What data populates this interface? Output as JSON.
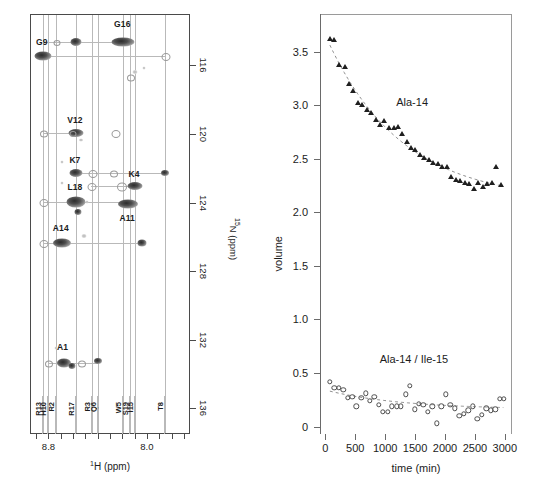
{
  "figure": {
    "panels": [
      "hsqc-spectrum",
      "kinetics-plot"
    ]
  },
  "hsqc": {
    "xaxis": {
      "title_pre": "1",
      "title": "H (ppm)",
      "ticks": [
        {
          "label": "",
          "ppm": 8.9
        },
        {
          "label": "8.8",
          "ppm": 8.8
        },
        {
          "label": "",
          "ppm": 8.7
        },
        {
          "label": "",
          "ppm": 8.6
        },
        {
          "label": "",
          "ppm": 8.5
        },
        {
          "label": "",
          "ppm": 8.4
        },
        {
          "label": "",
          "ppm": 8.3
        },
        {
          "label": "",
          "ppm": 8.2
        },
        {
          "label": "",
          "ppm": 8.1
        },
        {
          "label": "8.0",
          "ppm": 8.0
        },
        {
          "label": "",
          "ppm": 7.9
        },
        {
          "label": "",
          "ppm": 7.8
        },
        {
          "label": "",
          "ppm": 7.7
        }
      ],
      "range": [
        8.95,
        7.65
      ]
    },
    "yaxis": {
      "title_pre": "15",
      "title": "N (ppm)",
      "ticks": [
        "116",
        "120",
        "124",
        "128",
        "132",
        "136"
      ],
      "range": [
        113.0,
        137.5
      ]
    },
    "residue_ticks": [
      {
        "label": "R13",
        "ppm": 8.855
      },
      {
        "label": "H10",
        "ppm": 8.815
      },
      {
        "label": "R2",
        "ppm": 8.745
      },
      {
        "label": "R17",
        "ppm": 8.585
      },
      {
        "label": "R3",
        "ppm": 8.455
      },
      {
        "label": "Q6",
        "ppm": 8.405
      },
      {
        "label": "W5",
        "ppm": 8.2
      },
      {
        "label": "S19",
        "ppm": 8.145
      },
      {
        "label": "I15",
        "ppm": 8.105
      },
      {
        "label": "T8",
        "ppm": 7.865
      }
    ],
    "peak_labels": [
      {
        "text": "G9",
        "h": 8.855,
        "n": 114.9
      },
      {
        "text": "G16",
        "h": 8.2,
        "n": 113.9
      },
      {
        "text": "V12",
        "h": 8.585,
        "n": 119.5
      },
      {
        "text": "K7",
        "h": 8.585,
        "n": 121.8
      },
      {
        "text": "K4",
        "h": 8.105,
        "n": 122.6
      },
      {
        "text": "L18",
        "h": 8.585,
        "n": 123.4
      },
      {
        "text": "A11",
        "h": 8.16,
        "n": 125.2
      },
      {
        "text": "A14",
        "h": 8.7,
        "n": 125.8
      },
      {
        "text": "A1",
        "h": 8.685,
        "n": 132.7
      }
    ],
    "peaks": [
      {
        "h": 8.855,
        "n": 115.4,
        "w": 17,
        "hgt": 9,
        "style": "strong"
      },
      {
        "h": 8.585,
        "n": 114.6,
        "w": 11,
        "hgt": 8,
        "style": "strong"
      },
      {
        "h": 8.2,
        "n": 114.6,
        "w": 23,
        "hgt": 9,
        "style": "strong"
      },
      {
        "h": 8.745,
        "n": 114.6,
        "w": 5,
        "hgt": 4,
        "style": "ring"
      },
      {
        "h": 7.865,
        "n": 115.4,
        "w": 7,
        "hgt": 6,
        "style": "ring"
      },
      {
        "h": 8.105,
        "n": 116.3,
        "w": 5,
        "hgt": 4,
        "style": "tiny"
      },
      {
        "h": 8.145,
        "n": 116.6,
        "w": 6,
        "hgt": 5,
        "style": "ring"
      },
      {
        "h": 8.03,
        "n": 116.1,
        "w": 3,
        "hgt": 3,
        "style": "tiny"
      },
      {
        "h": 8.585,
        "n": 119.9,
        "w": 15,
        "hgt": 8,
        "style": "strong"
      },
      {
        "h": 8.855,
        "n": 119.9,
        "w": 6,
        "hgt": 5,
        "style": "ring"
      },
      {
        "h": 8.62,
        "n": 119.9,
        "w": 5,
        "hgt": 4,
        "style": "ring"
      },
      {
        "h": 8.265,
        "n": 119.9,
        "w": 7,
        "hgt": 6,
        "style": "ring"
      },
      {
        "h": 8.54,
        "n": 120.3,
        "w": 4,
        "hgt": 3,
        "style": "tiny"
      },
      {
        "h": 8.585,
        "n": 122.2,
        "w": 13,
        "hgt": 8,
        "style": "strong"
      },
      {
        "h": 8.455,
        "n": 122.2,
        "w": 7,
        "hgt": 6,
        "style": "ring"
      },
      {
        "h": 8.28,
        "n": 122.2,
        "w": 6,
        "hgt": 5,
        "style": "ring"
      },
      {
        "h": 7.865,
        "n": 122.2,
        "w": 8,
        "hgt": 6,
        "style": "strong"
      },
      {
        "h": 8.105,
        "n": 123.0,
        "w": 15,
        "hgt": 8,
        "style": "strong"
      },
      {
        "h": 8.215,
        "n": 123.0,
        "w": 8,
        "hgt": 7,
        "style": "ring"
      },
      {
        "h": 8.465,
        "n": 123.0,
        "w": 7,
        "hgt": 6,
        "style": "ring"
      },
      {
        "h": 8.7,
        "n": 121.6,
        "w": 3,
        "hgt": 3,
        "style": "tiny"
      },
      {
        "h": 8.7,
        "n": 122.8,
        "w": 3,
        "hgt": 3,
        "style": "tiny"
      },
      {
        "h": 8.585,
        "n": 123.9,
        "w": 19,
        "hgt": 11,
        "style": "strong"
      },
      {
        "h": 8.16,
        "n": 124.0,
        "w": 20,
        "hgt": 9,
        "style": "strong"
      },
      {
        "h": 8.855,
        "n": 123.9,
        "w": 7,
        "hgt": 6,
        "style": "ring"
      },
      {
        "h": 8.57,
        "n": 124.5,
        "w": 7,
        "hgt": 6,
        "style": "strong"
      },
      {
        "h": 8.495,
        "n": 123.9,
        "w": 3,
        "hgt": 3,
        "style": "tiny"
      },
      {
        "h": 8.7,
        "n": 126.3,
        "w": 18,
        "hgt": 9,
        "style": "strong"
      },
      {
        "h": 8.855,
        "n": 126.3,
        "w": 7,
        "hgt": 6,
        "style": "ring"
      },
      {
        "h": 8.045,
        "n": 126.3,
        "w": 9,
        "hgt": 7,
        "style": "strong"
      },
      {
        "h": 8.52,
        "n": 125.9,
        "w": 5,
        "hgt": 4,
        "style": "tiny"
      },
      {
        "h": 8.685,
        "n": 133.3,
        "w": 14,
        "hgt": 9,
        "style": "strong"
      },
      {
        "h": 8.815,
        "n": 133.3,
        "w": 6,
        "hgt": 5,
        "style": "ring"
      },
      {
        "h": 8.62,
        "n": 133.5,
        "w": 7,
        "hgt": 6,
        "style": "strong"
      },
      {
        "h": 8.54,
        "n": 133.3,
        "w": 6,
        "hgt": 5,
        "style": "ring"
      },
      {
        "h": 8.405,
        "n": 133.2,
        "w": 8,
        "hgt": 6,
        "style": "strong"
      },
      {
        "h": 8.745,
        "n": 132.4,
        "w": 3,
        "hgt": 3,
        "style": "tiny"
      }
    ],
    "connect_lines_h": [
      {
        "n": 114.6,
        "h1": 8.855,
        "h2": 8.2
      },
      {
        "n": 115.4,
        "h1": 8.855,
        "h2": 7.865
      },
      {
        "n": 119.9,
        "h1": 8.855,
        "h2": 8.585
      },
      {
        "n": 122.2,
        "h1": 8.585,
        "h2": 7.865
      },
      {
        "n": 123.0,
        "h1": 8.465,
        "h2": 8.105
      },
      {
        "n": 123.9,
        "h1": 8.855,
        "h2": 8.16
      },
      {
        "n": 126.3,
        "h1": 8.855,
        "h2": 8.045
      },
      {
        "n": 133.3,
        "h1": 8.815,
        "h2": 8.405
      }
    ]
  },
  "chart_data": {
    "type": "scatter",
    "title": "",
    "xlabel": "time (min)",
    "ylabel": "volume",
    "xlim": [
      -90,
      3120
    ],
    "ylim": [
      -0.07,
      3.85
    ],
    "xticks": [
      0,
      500,
      1000,
      1500,
      2000,
      2500,
      3000
    ],
    "xtick_labels": [
      "0",
      "500",
      "1000",
      "1500",
      "2000",
      "2500",
      "3000"
    ],
    "yticks": [
      0,
      0.5,
      1.0,
      1.5,
      2.0,
      2.5,
      3.0,
      3.5
    ],
    "ytick_labels": [
      "0",
      "0.5",
      "1.0",
      "1.5",
      "2.0",
      "2.5",
      "3.0",
      "3.5"
    ],
    "grid": false,
    "legend": "annotations-inline",
    "annotations": [
      {
        "text": "Ala-14",
        "x": 1450,
        "y": 3.02
      },
      {
        "text": "Ala-14 / Ile-15",
        "x": 1480,
        "y": 0.62
      }
    ],
    "series": [
      {
        "name": "Ala-14",
        "marker": "triangle",
        "color": "#1f1f1f",
        "x": [
          75,
          150,
          235,
          320,
          400,
          470,
          545,
          620,
          690,
          760,
          840,
          915,
          985,
          1060,
          1140,
          1210,
          1285,
          1360,
          1430,
          1500,
          1580,
          1650,
          1725,
          1800,
          1880,
          1955,
          2030,
          2100,
          2180,
          2255,
          2330,
          2400,
          2480,
          2555,
          2630,
          2705,
          2780,
          2860,
          2940
        ],
        "y": [
          3.62,
          3.61,
          3.37,
          3.36,
          3.2,
          3.13,
          3.02,
          3.0,
          2.95,
          2.93,
          2.86,
          2.81,
          2.85,
          2.79,
          2.79,
          2.8,
          2.73,
          2.66,
          2.6,
          2.58,
          2.53,
          2.51,
          2.49,
          2.46,
          2.45,
          2.42,
          2.42,
          2.33,
          2.3,
          2.29,
          2.27,
          2.26,
          2.22,
          2.27,
          2.24,
          2.26,
          2.27,
          2.42,
          2.25
        ],
        "fit_curve": {
          "type": "exponential-decay",
          "y0": 3.56,
          "y_end": 2.1
        }
      },
      {
        "name": "Ala-14 / Ile-15",
        "marker": "circle",
        "color": "#4d4d4d",
        "x": [
          75,
          150,
          225,
          300,
          375,
          450,
          520,
          600,
          675,
          745,
          820,
          895,
          965,
          1040,
          1115,
          1190,
          1265,
          1340,
          1415,
          1490,
          1565,
          1640,
          1715,
          1790,
          1865,
          1940,
          2015,
          2090,
          2165,
          2240,
          2315,
          2390,
          2465,
          2540,
          2615,
          2690,
          2765,
          2840,
          2915,
          2985
        ],
        "y": [
          0.42,
          0.36,
          0.36,
          0.34,
          0.27,
          0.28,
          0.19,
          0.27,
          0.31,
          0.24,
          0.28,
          0.2,
          0.14,
          0.14,
          0.19,
          0.19,
          0.19,
          0.3,
          0.38,
          0.16,
          0.21,
          0.2,
          0.14,
          0.19,
          0.03,
          0.19,
          0.3,
          0.2,
          0.17,
          0.1,
          0.12,
          0.15,
          0.19,
          0.07,
          0.11,
          0.17,
          0.15,
          0.16,
          0.26,
          0.26
        ],
        "fit_curve": {
          "type": "flat-decay",
          "y0": 0.33,
          "y_end": 0.16
        }
      }
    ]
  }
}
